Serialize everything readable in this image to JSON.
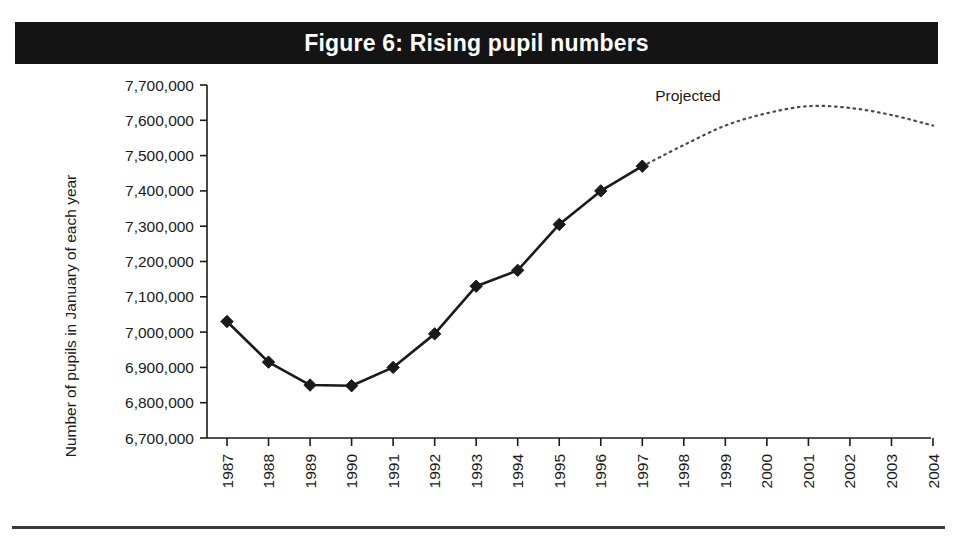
{
  "figure": {
    "title": "Figure 6: Rising pupil numbers",
    "title_band_color": "#141414",
    "title_text_color": "#ffffff",
    "background_color": "#ffffff",
    "rule_color": "#3a3a3a"
  },
  "chart_data": {
    "type": "line",
    "title": "Figure 6: Rising pupil numbers",
    "xlabel": "Year",
    "ylabel": "Number of pupils in January of each year",
    "xlim": [
      1987,
      2004
    ],
    "ylim": [
      6700000,
      7700000
    ],
    "ytick_step": 100000,
    "grid": false,
    "legend": "none",
    "line_color": "#1a1a1a",
    "marker": "diamond",
    "categories": [
      "1987",
      "1988",
      "1989",
      "1990",
      "1991",
      "1992",
      "1993",
      "1994",
      "1995",
      "1996",
      "1997",
      "1998",
      "1999",
      "2000",
      "2001",
      "2002",
      "2003",
      "2004"
    ],
    "ytick_labels": [
      "7,700,000",
      "7,600,000",
      "7,500,000",
      "7,400,000",
      "7,300,000",
      "7,200,000",
      "7,100,000",
      "7,000,000",
      "6,900,000",
      "6,800,000",
      "6,700,000"
    ],
    "ytick_values": [
      7700000,
      7600000,
      7500000,
      7400000,
      7300000,
      7200000,
      7100000,
      7000000,
      6900000,
      6800000,
      6700000
    ],
    "series": [
      {
        "name": "Actual",
        "style": "solid-with-markers",
        "x": [
          1987,
          1988,
          1989,
          1990,
          1991,
          1992,
          1993,
          1994,
          1995,
          1996,
          1997
        ],
        "values": [
          7030000,
          6915000,
          6850000,
          6848000,
          6900000,
          6995000,
          7130000,
          7175000,
          7305000,
          7400000,
          7470000
        ]
      },
      {
        "name": "Projected",
        "style": "dotted",
        "x": [
          1997,
          1998,
          1999,
          2000,
          2001,
          2002,
          2003,
          2004
        ],
        "values": [
          7470000,
          7530000,
          7585000,
          7620000,
          7640000,
          7635000,
          7615000,
          7585000
        ]
      }
    ],
    "annotations": [
      {
        "text": "Projected",
        "x": 1998.1,
        "y": 7655000
      }
    ]
  }
}
